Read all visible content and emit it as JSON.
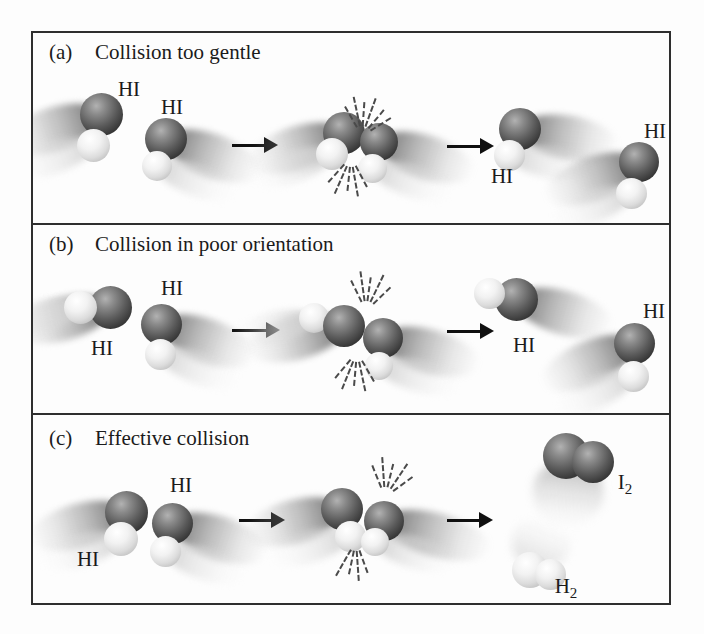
{
  "figure": {
    "panels": [
      {
        "tag": "(a)",
        "title": "Collision too gentle",
        "molecule_labels": [
          "HI",
          "HI",
          "HI",
          "HI"
        ]
      },
      {
        "tag": "(b)",
        "title": "Collision in poor orientation",
        "molecule_labels": [
          "HI",
          "HI",
          "HI",
          "HI"
        ]
      },
      {
        "tag": "(c)",
        "title": "Effective collision",
        "molecule_labels": [
          "HI",
          "HI"
        ],
        "products": [
          {
            "symbol": "I",
            "subscript": "2"
          },
          {
            "symbol": "H",
            "subscript": "2"
          }
        ]
      }
    ],
    "atoms": {
      "dark_sphere": "iodine",
      "light_sphere": "hydrogen"
    },
    "colors": {
      "frame": "#2e2e2e",
      "iodine_dark": "#1d1d1d",
      "iodine_highlight": "#b2b2b2",
      "hydrogen_light": "#ffffff",
      "hydrogen_shade": "#9f9f9f",
      "arrow": "#101010",
      "spark": "#4a4a4a",
      "background": "#fdfdfd"
    }
  }
}
